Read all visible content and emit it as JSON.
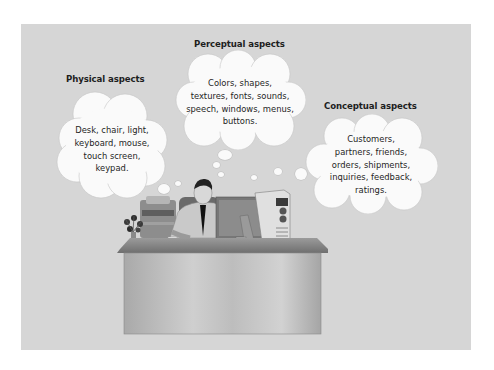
{
  "figure": {
    "background_color": "#d6d6d6",
    "cloud_color": "#fafafa",
    "text_color": "#1e1e1e"
  },
  "clouds": [
    {
      "id": "physical",
      "heading": "Physical aspects",
      "text": "Desk, chair, light,\nkeyboard, mouse,\ntouch screen,\nkeypad."
    },
    {
      "id": "perceptual",
      "heading": "Perceptual aspects",
      "text": "Colors, shapes,\ntextures, fonts, sounds,\nspeech, windows, menus,\nbuttons."
    },
    {
      "id": "conceptual",
      "heading": "Conceptual aspects",
      "text": "Customers,\npartners, friends,\norders, shipments,\ninquiries, feedback,\nratings."
    }
  ],
  "scene": {
    "subject": "person-at-desk-with-computer",
    "objects": [
      "desk",
      "chair",
      "monitor",
      "computer-tower",
      "keyboard",
      "mouse",
      "printer",
      "plant",
      "papers",
      "cup",
      "phone"
    ]
  }
}
